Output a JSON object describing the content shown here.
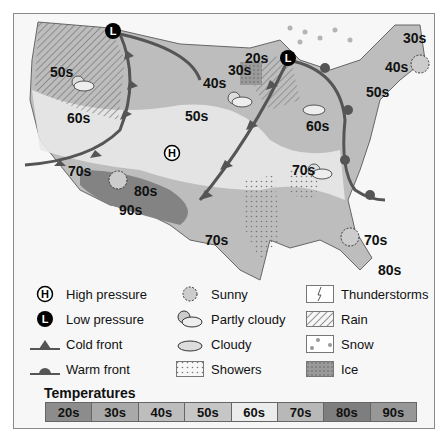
{
  "map": {
    "temperature_labels": [
      {
        "text": "50s",
        "x": 50,
        "y": 64
      },
      {
        "text": "60s",
        "x": 67,
        "y": 110
      },
      {
        "text": "70s",
        "x": 68,
        "y": 163
      },
      {
        "text": "80s",
        "x": 134,
        "y": 183
      },
      {
        "text": "90s",
        "x": 119,
        "y": 202
      },
      {
        "text": "40s",
        "x": 203,
        "y": 75
      },
      {
        "text": "50s",
        "x": 185,
        "y": 108
      },
      {
        "text": "30s",
        "x": 228,
        "y": 62
      },
      {
        "text": "20s",
        "x": 245,
        "y": 50
      },
      {
        "text": "70s",
        "x": 205,
        "y": 232
      },
      {
        "text": "60s",
        "x": 306,
        "y": 118
      },
      {
        "text": "70s",
        "x": 292,
        "y": 162
      },
      {
        "text": "70s",
        "x": 364,
        "y": 232
      },
      {
        "text": "80s",
        "x": 378,
        "y": 262
      },
      {
        "text": "30s",
        "x": 403,
        "y": 30
      },
      {
        "text": "40s",
        "x": 385,
        "y": 59
      },
      {
        "text": "50s",
        "x": 366,
        "y": 84
      }
    ],
    "pressure_markers": [
      {
        "type": "L",
        "x": 113,
        "y": 31
      },
      {
        "type": "L",
        "x": 288,
        "y": 58
      },
      {
        "type": "H",
        "x": 172,
        "y": 153
      }
    ]
  },
  "legend": {
    "items": [
      {
        "label": "High pressure",
        "icon": "high-pressure-icon"
      },
      {
        "label": "Low pressure",
        "icon": "low-pressure-icon"
      },
      {
        "label": "Cold front",
        "icon": "cold-front-icon"
      },
      {
        "label": "Warm front",
        "icon": "warm-front-icon"
      },
      {
        "label": "Sunny",
        "icon": "sunny-icon"
      },
      {
        "label": "Partly cloudy",
        "icon": "partly-cloudy-icon"
      },
      {
        "label": "Cloudy",
        "icon": "cloudy-icon"
      },
      {
        "label": "Showers",
        "icon": "showers-icon"
      },
      {
        "label": "Thunderstorms",
        "icon": "thunderstorms-icon"
      },
      {
        "label": "Rain",
        "icon": "rain-icon"
      },
      {
        "label": "Snow",
        "icon": "snow-icon"
      },
      {
        "label": "Ice",
        "icon": "ice-icon"
      }
    ]
  },
  "temperatures": {
    "title": "Temperatures",
    "scale": [
      {
        "label": "20s",
        "color": "#8c8c8c"
      },
      {
        "label": "30s",
        "color": "#a9a9a9"
      },
      {
        "label": "40s",
        "color": "#bdbdbd"
      },
      {
        "label": "50s",
        "color": "#c6c6c6"
      },
      {
        "label": "60s",
        "color": "#ececec"
      },
      {
        "label": "70s",
        "color": "#b8b8b8"
      },
      {
        "label": "80s",
        "color": "#7e7e7e"
      },
      {
        "label": "90s",
        "color": "#979797"
      }
    ]
  }
}
